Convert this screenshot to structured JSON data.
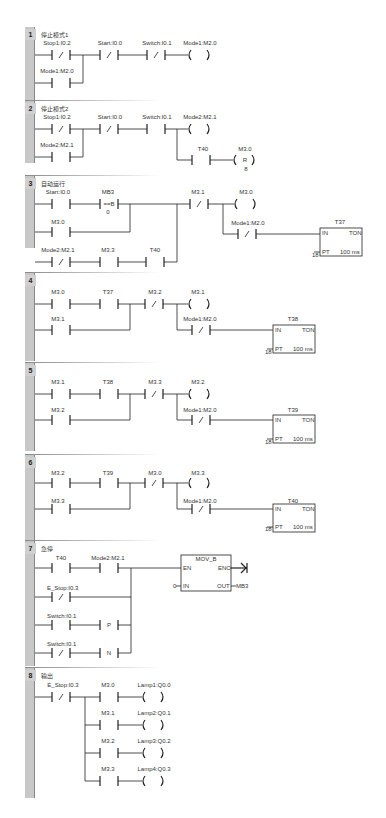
{
  "networks": [
    {
      "num": "1",
      "comment": "停止模式1",
      "labels": {
        "c1": "Stop1:I0.2",
        "c2": "Start:I0.0",
        "c3": "Switch:I0.1",
        "coil": "Mode1:M2.0",
        "p1": "Mode1:M2.0"
      }
    },
    {
      "num": "2",
      "comment": "停止模式2",
      "labels": {
        "c1": "Stop1:I0.2",
        "c2": "Start:I0.0",
        "c3": "Switch:I0.1",
        "coil": "Mode2:M2.1",
        "p1": "Mode2:M2.1",
        "c4": "T40",
        "coil2": "M3.0",
        "coil2_type": "R",
        "coil2_n": "8"
      }
    },
    {
      "num": "3",
      "comment": "自动运行",
      "labels": {
        "c1": "Start:I0.0",
        "cmp": "MB3",
        "cmp_op": "==B",
        "cmp_val": "0",
        "p1": "M3.0",
        "r3c1": "Mode2:M2.1",
        "r3c2": "M3.3",
        "r3c3": "T40",
        "c2": "M3.1",
        "coil": "M3.0",
        "c3": "Mode1:M2.0",
        "timer": "T37",
        "in": "IN",
        "ton": "TON",
        "pt": "PT",
        "pt_val": "18",
        "base": "100 ms"
      }
    },
    {
      "num": "4",
      "comment": "",
      "labels": {
        "c1": "M3.0",
        "c2": "T37",
        "c3": "M3.2",
        "coil": "M3.1",
        "p1": "M3.1",
        "c4": "Mode1:M2.0",
        "timer": "T38",
        "in": "IN",
        "ton": "TON",
        "pt": "PT",
        "pt_val": "18",
        "base": "100 ms"
      }
    },
    {
      "num": "5",
      "comment": "",
      "labels": {
        "c1": "M3.1",
        "c2": "T38",
        "c3": "M3.3",
        "coil": "M3.2",
        "p1": "M3.2",
        "c4": "Mode1:M2.0",
        "timer": "T39",
        "in": "IN",
        "ton": "TON",
        "pt": "PT",
        "pt_val": "18",
        "base": "100 ms"
      }
    },
    {
      "num": "6",
      "comment": "",
      "labels": {
        "c1": "M3.2",
        "c2": "T39",
        "c3": "M3.0",
        "coil": "M3.3",
        "p1": "M3.3",
        "c4": "Mode1:M2.0",
        "timer": "T40",
        "in": "IN",
        "ton": "TON",
        "pt": "PT",
        "pt_val": "18",
        "base": "100 ms"
      }
    },
    {
      "num": "7",
      "comment": "急停",
      "labels": {
        "c1": "T40",
        "c2": "Mode2:M2.1",
        "r2": "E_Stop:I0.3",
        "r3": "Switch:I0.1",
        "r3p": "P",
        "r4": "Switch:I0.1",
        "r4n": "N",
        "box": "MOV_B",
        "en": "EN",
        "eno": "ENO",
        "in": "IN",
        "out": "OUT",
        "in_val": "0",
        "out_val": "MB3"
      }
    },
    {
      "num": "8",
      "comment": "输出",
      "labels": {
        "c1": "E_Stop:I0.3",
        "b1": "M3.0",
        "o1": "Lamp1:Q0.0",
        "b2": "M3.1",
        "o2": "Lamp2:Q0.1",
        "b3": "M3.2",
        "o3": "Lamp3:Q0.2",
        "b4": "M3.3",
        "o4": "Lamp4:Q0.3"
      }
    }
  ]
}
